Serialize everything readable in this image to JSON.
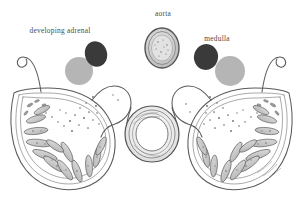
{
  "figure": {
    "background_color": "#ffffff",
    "ink_color": "#4a4a4a",
    "width": 303,
    "height": 216
  },
  "labels": {
    "developing_adrenal": "developing adrenal",
    "aorta": "aorta",
    "medulla": "medulla",
    "cortex": "cortex"
  },
  "key_swatches": [
    {
      "id": "medulla-left",
      "name": "medulla-swatch-left",
      "color": "#3a3a3a",
      "cx": 96,
      "cy": 54,
      "rx": 11,
      "ry": 13,
      "rotate": -18
    },
    {
      "id": "cortex-left",
      "name": "cortex-swatch-left",
      "color": "#b5b5b5",
      "cx": 79,
      "cy": 71,
      "rx": 14,
      "ry": 14,
      "rotate": 0
    },
    {
      "id": "medulla-right",
      "name": "medulla-swatch-right",
      "color": "#3a3a3a",
      "cx": 206,
      "cy": 57,
      "rx": 12,
      "ry": 13,
      "rotate": 14
    },
    {
      "id": "cortex-right",
      "name": "cortex-swatch-right",
      "color": "#b5b5b5",
      "cx": 230,
      "cy": 71,
      "rx": 15,
      "ry": 15,
      "rotate": 0
    }
  ],
  "structures": {
    "aorta": {
      "name": "aorta-cross-section",
      "cx": 162,
      "cy": 48,
      "rx": 17,
      "ry": 20,
      "fill": "#d8d8d8",
      "stroke": "#555555"
    },
    "central_vessel": {
      "name": "central-vessel-cross-section",
      "cx": 152,
      "cy": 134,
      "outer_rx": 27,
      "outer_ry": 28,
      "lumen_rx": 15,
      "lumen_ry": 15
    },
    "left_gland": {
      "name": "left-adrenal-gland",
      "cord_count": 13
    },
    "right_gland": {
      "name": "right-adrenal-gland",
      "cord_count": 13
    }
  }
}
